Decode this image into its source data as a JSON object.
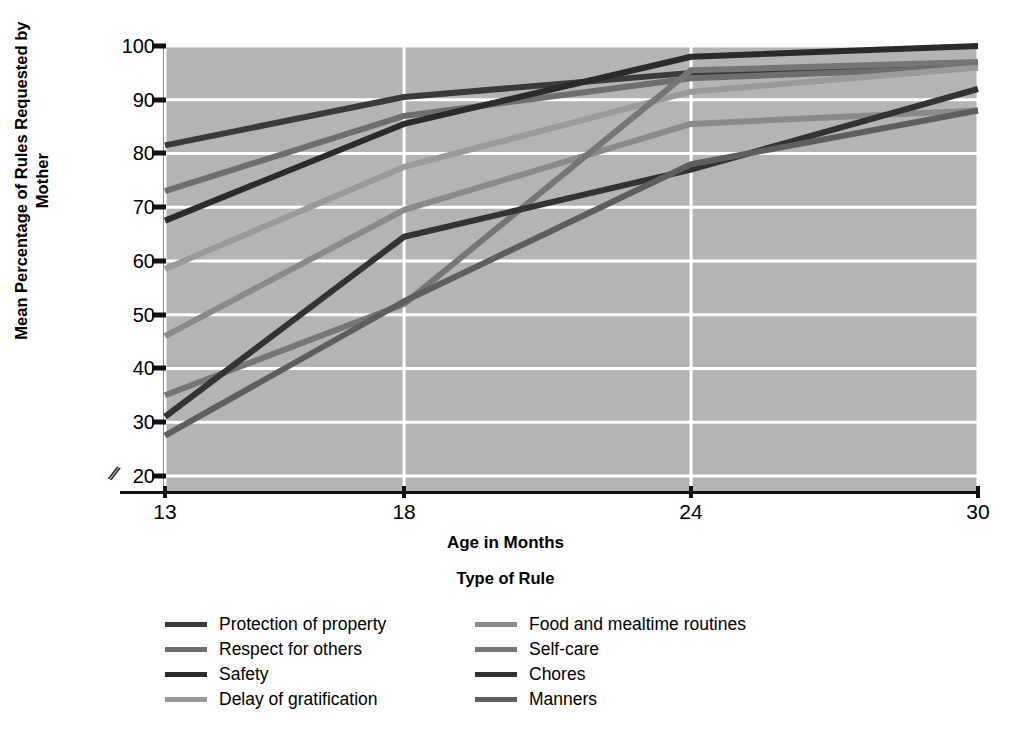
{
  "chart_data": {
    "type": "line",
    "title": "",
    "xlabel": "Age in Months",
    "ylabel": "Mean Percentage of Rules Requested by Mother",
    "legend_title": "Type of Rule",
    "legend_position": "bottom",
    "grid": true,
    "x": [
      13,
      18,
      24,
      30
    ],
    "xtick_labels": [
      "13",
      "18",
      "24",
      "30"
    ],
    "ytick_labels": [
      "20",
      "30",
      "40",
      "50",
      "60",
      "70",
      "80",
      "90",
      "100"
    ],
    "yticks": [
      20,
      30,
      40,
      50,
      60,
      70,
      80,
      90,
      100
    ],
    "ylim": [
      17,
      100
    ],
    "xlim": [
      13,
      30
    ],
    "axis_break": "//",
    "background_color": "#b4b4b4",
    "gridline_color": "#ffffff",
    "series": [
      {
        "name": "Protection of property",
        "values": [
          81.5,
          90.5,
          95.0,
          96.5
        ],
        "color": "#3a3a3a"
      },
      {
        "name": "Respect for others",
        "values": [
          73.0,
          87.0,
          94.0,
          96.0
        ],
        "color": "#6e6e6e"
      },
      {
        "name": "Safety",
        "values": [
          67.5,
          85.5,
          98.0,
          100.0
        ],
        "color": "#2b2b2b"
      },
      {
        "name": "Delay of gratification",
        "values": [
          58.5,
          77.5,
          91.5,
          96.0
        ],
        "color": "#9a9a9a"
      },
      {
        "name": "Food and mealtime routines",
        "values": [
          46.0,
          69.5,
          85.5,
          88.0
        ],
        "color": "#8a8a8a"
      },
      {
        "name": "Self-care",
        "values": [
          35.0,
          52.0,
          95.5,
          97.0
        ],
        "color": "#767676"
      },
      {
        "name": "Chores",
        "values": [
          31.0,
          64.5,
          77.0,
          92.0
        ],
        "color": "#333333"
      },
      {
        "name": "Manners",
        "values": [
          27.5,
          52.5,
          78.0,
          88.0
        ],
        "color": "#5e5e5e"
      }
    ]
  }
}
